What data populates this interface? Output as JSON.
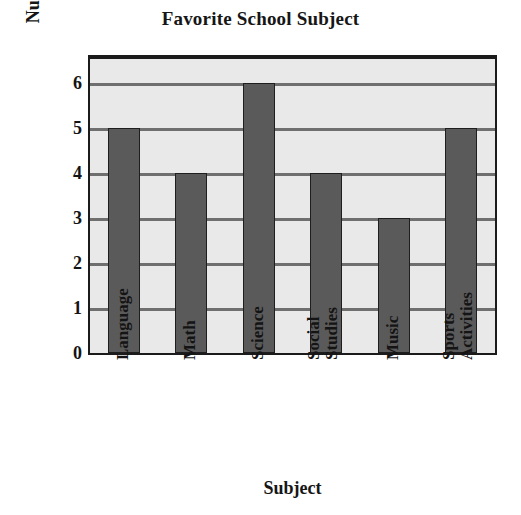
{
  "chart_data": {
    "type": "bar",
    "title": "Favorite School Subject",
    "xlabel": "Subject",
    "ylabel": "Number of Students",
    "categories": [
      "Language",
      "Math",
      "Science",
      "Social Studies",
      "Music",
      "Sports Activities"
    ],
    "values": [
      5,
      4,
      6,
      4,
      3,
      5
    ],
    "ylim": [
      0,
      6.6
    ],
    "yticks": [
      "6",
      "5",
      "4",
      "3",
      "2",
      "1",
      "0"
    ],
    "ytick_values": [
      6,
      5,
      4,
      3,
      2,
      1,
      0
    ],
    "grid": true,
    "legend": null,
    "legend_position": "none",
    "colors": {
      "bar_fill": "#5a5a5a",
      "bar_outline": "#1e1e1e",
      "plot_background": "#e9e9e9",
      "frame": "#1b1b1b",
      "gridline": "#6f6f6f",
      "text": "#141414",
      "page_background": "#ffffff"
    }
  }
}
